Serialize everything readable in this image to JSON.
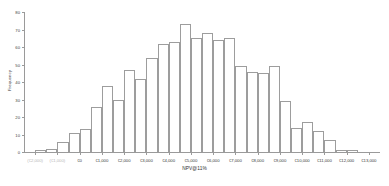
{
  "chart_data": {
    "type": "bar",
    "title": "",
    "xlabel": "NPV@11%",
    "ylabel": "Frequency",
    "ylim": [
      0,
      80
    ],
    "yticks": [
      0,
      10,
      20,
      30,
      40,
      50,
      60,
      70,
      80
    ],
    "grid": false,
    "legend": null,
    "bin_width": 500,
    "x_tick_labels": [
      "(€2,000)",
      "(€1,000)",
      "€0",
      "€1,000",
      "€2,000",
      "€3,000",
      "€4,000",
      "€5,000",
      "€6,000",
      "€7,000",
      "€8,000",
      "€9,000",
      "€10,000",
      "€11,000",
      "€12,000",
      "€13,000"
    ],
    "x_tick_muted": [
      true,
      true,
      false,
      false,
      false,
      false,
      false,
      false,
      false,
      false,
      false,
      false,
      false,
      false,
      false,
      false
    ],
    "categories": [
      "-2000",
      "-1500",
      "-1000",
      "-500",
      "0",
      "500",
      "1000",
      "1500",
      "2000",
      "2500",
      "3000",
      "3500",
      "4000",
      "4500",
      "5000",
      "5500",
      "6000",
      "6500",
      "7000",
      "7500",
      "8000",
      "8500",
      "9000",
      "9500",
      "10000",
      "10500",
      "11000",
      "11500",
      "12000",
      "12500"
    ],
    "values": [
      1,
      2,
      6,
      11,
      13,
      26,
      38,
      30,
      47,
      42,
      54,
      62,
      63,
      73,
      65,
      68,
      64,
      65,
      49,
      46,
      45,
      49,
      29,
      14,
      17,
      12,
      7,
      1,
      1,
      0
    ]
  },
  "colors": {
    "bar_stroke": "#9d9d9d",
    "bar_fill": "#ffffff",
    "axis": "#9a9a9a",
    "text": "#3a3a3a",
    "muted_text": "#b9b9b9",
    "background": "#ffffff"
  }
}
